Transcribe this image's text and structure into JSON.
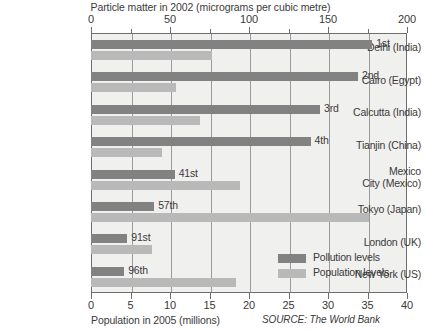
{
  "chart_data": {
    "type": "bar",
    "orientation": "horizontal",
    "title": "Particle matter in 2002 (micrograms per cubic metre)",
    "xlabel_top": "Particle matter in 2002 (micrograms per cubic metre)",
    "xlabel_bottom": "Population in 2005 (millions)",
    "source": "SOURCE: The World Bank",
    "grid": true,
    "legend_position": "bottom-right",
    "categories": [
      "Delhi (India)",
      "Cairo (Egypt)",
      "Calcutta (India)",
      "Tianjin (China)",
      "Mexico City (Mexico)",
      "Tokyo (Japan)",
      "London (UK)",
      "New York (US)"
    ],
    "category_lines": [
      [
        "Delhi (India)"
      ],
      [
        "Cairo (Egypt)"
      ],
      [
        "Calcutta (India)"
      ],
      [
        "Tianjin (China)"
      ],
      [
        "Mexico",
        "City (Mexico)"
      ],
      [
        "Tokyo (Japan)"
      ],
      [
        "London (UK)"
      ],
      [
        "New York (US)"
      ]
    ],
    "axis_top": {
      "label": "Particle matter in 2002 (micrograms per cubic metre)",
      "min": 0,
      "max": 200,
      "major_ticks": [
        0,
        50,
        100,
        150,
        200
      ],
      "minor_ticks": [
        25,
        75,
        125,
        175
      ],
      "ticklabels": [
        "0",
        "50",
        "100",
        "150",
        "200"
      ]
    },
    "axis_bottom": {
      "label": "Population in 2005 (millions)",
      "min": 0,
      "max": 40,
      "major_ticks": [
        0,
        5,
        10,
        15,
        20,
        25,
        30,
        35,
        40
      ],
      "ticklabels": [
        "0",
        "5",
        "10",
        "15",
        "20",
        "25",
        "30",
        "35",
        "40"
      ]
    },
    "series": [
      {
        "name": "Pollution levels",
        "key": "pollution",
        "color": "#828282",
        "axis": "top",
        "unit": "micrograms per cubic metre",
        "values": [
          178,
          169,
          145,
          139,
          53,
          40,
          23,
          21
        ]
      },
      {
        "name": "Population levels",
        "key": "population",
        "color": "#b9b9b9",
        "axis": "bottom",
        "unit": "millions",
        "values": [
          15.3,
          10.8,
          13.8,
          9.0,
          18.8,
          35.2,
          7.7,
          18.4
        ]
      }
    ],
    "rank_labels": [
      "1st",
      "2nd",
      "3rd",
      "4th",
      "41st",
      "57th",
      "91st",
      "96th"
    ],
    "legend": [
      {
        "label": "Pollution levels",
        "color": "#828282"
      },
      {
        "label": "Population levels",
        "color": "#b9b9b9"
      }
    ]
  }
}
